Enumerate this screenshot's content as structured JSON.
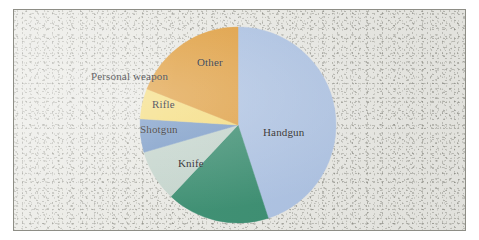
{
  "figure": {
    "width": 479,
    "height": 240,
    "background_color": "#ffffff",
    "paper_color": "#e9e9e4",
    "border_color": "#8e8e86"
  },
  "chart_data": {
    "type": "pie",
    "title": "",
    "subtitle": "",
    "xlabel": "",
    "ylabel": "",
    "legend_position": "none",
    "labels_position": "inside-and-outside",
    "start_angle_deg": 0,
    "direction": "clockwise",
    "categories": [
      "Handgun",
      "Knife",
      "Shotgun",
      "Rifle",
      "Personal weapon",
      "Other"
    ],
    "values": [
      45.0,
      17.0,
      8.5,
      5.5,
      5.0,
      19.0
    ],
    "units": "percent",
    "colors": [
      "#aec3e3",
      "#3d8f72",
      "#c5d5cd",
      "#7d9dc8",
      "#f5dd7f",
      "#e0a043"
    ],
    "slices": [
      {
        "label": "Handgun",
        "value": 45.0,
        "color": "#aec3e3",
        "start_angle_deg": 0,
        "end_angle_deg": 162,
        "label_x": 264,
        "label_y": 122,
        "label_placement": "inside"
      },
      {
        "label": "Knife",
        "value": 17.0,
        "color": "#3d8f72",
        "start_angle_deg": 162,
        "end_angle_deg": 223.2,
        "label_x": 180,
        "label_y": 153,
        "label_placement": "inside"
      },
      {
        "label": "Shotgun",
        "value": 8.5,
        "color": "#c5d5cd",
        "start_angle_deg": 223.2,
        "end_angle_deg": 253.8,
        "label_x": 136,
        "label_y": 119,
        "label_placement": "inside"
      },
      {
        "label": "Rifle",
        "value": 5.5,
        "color": "#7d9dc8",
        "start_angle_deg": 253.8,
        "end_angle_deg": 273.6,
        "label_x": 146,
        "label_y": 94,
        "label_placement": "inside"
      },
      {
        "label": "Personal weapon",
        "value": 5.0,
        "color": "#f5dd7f",
        "start_angle_deg": 273.6,
        "end_angle_deg": 291.6,
        "label_x": 82,
        "label_y": 66,
        "label_placement": "outside"
      },
      {
        "label": "Other",
        "value": 19.0,
        "color": "#e0a043",
        "start_angle_deg": 291.6,
        "end_angle_deg": 360,
        "label_x": 194,
        "label_y": 52,
        "label_placement": "inside"
      }
    ],
    "geometry": {
      "center_x": 224,
      "center_y": 115,
      "radius": 98
    }
  }
}
